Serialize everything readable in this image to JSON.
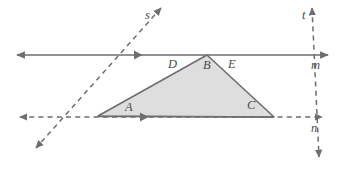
{
  "figure": {
    "type": "geometry-diagram",
    "background_color": "#ffffff",
    "stroke_color": "#6e6e72",
    "triangle_fill_color": "#dedede",
    "label_color": "#4a4a4a"
  },
  "points": [
    {
      "id": "A",
      "label": "A",
      "vertex_x": 98,
      "vertex_y": 116,
      "label_x": 125,
      "label_y": 111
    },
    {
      "id": "B",
      "label": "B",
      "vertex_x": 207,
      "vertex_y": 55,
      "label_x": 203,
      "label_y": 69
    },
    {
      "id": "C",
      "label": "C",
      "vertex_x": 274,
      "vertex_y": 117,
      "label_x": 247,
      "label_y": 109
    },
    {
      "id": "D",
      "label": "D",
      "vertex_x": 172,
      "vertex_y": 55,
      "label_x": 168,
      "label_y": 68
    },
    {
      "id": "E",
      "label": "E",
      "vertex_x": 232,
      "vertex_y": 55,
      "label_x": 228,
      "label_y": 68
    }
  ],
  "lines": [
    {
      "id": "m",
      "label": "m",
      "style": "solid",
      "orientation": "horizontal",
      "y": 55,
      "x_start": 17,
      "x_end": 328,
      "arrows": "both",
      "tick_x": 140,
      "label_x": 311,
      "label_y": 69
    },
    {
      "id": "n",
      "label": "n",
      "style": "dashed",
      "orientation": "horizontal",
      "y": 117,
      "x_start": 20,
      "x_end": 322,
      "arrows": "both",
      "tick_x": 146,
      "label_x": 311,
      "label_y": 132
    },
    {
      "id": "s",
      "label": "s",
      "style": "dashed",
      "orientation": "transversal",
      "from_x": 161,
      "from_y": 8,
      "to_x": 36,
      "to_y": 148,
      "arrows": "both",
      "label_x": 145,
      "label_y": 19
    },
    {
      "id": "t",
      "label": "t",
      "style": "dashed",
      "orientation": "transversal",
      "from_x": 312,
      "from_y": 8,
      "to_x": 319,
      "to_y": 157,
      "arrows": "both",
      "label_x": 302,
      "label_y": 19
    }
  ],
  "triangle": {
    "id": "ABC",
    "vertices": "98,116 207,55 274,117",
    "fill": "#dedede",
    "stroke": "#6e6e72"
  }
}
